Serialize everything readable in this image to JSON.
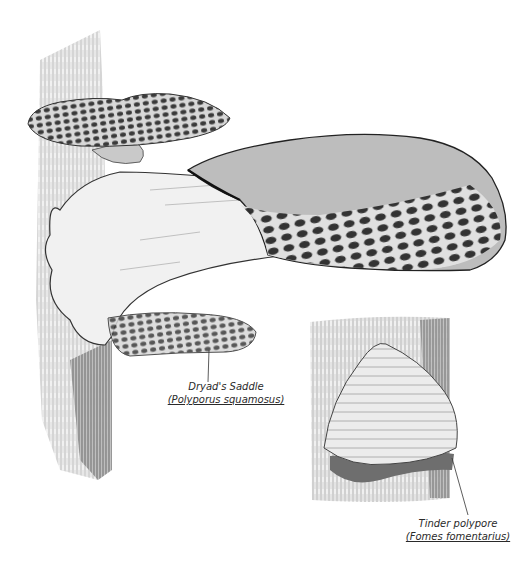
{
  "illustration": {
    "subject": "Pencil illustration of bracket fungi on tree trunks",
    "style": "graphite pencil sketch, monochrome",
    "colors": {
      "background": "#ffffff",
      "pencil_dark": "#2a2a2a",
      "pencil_mid": "#777777",
      "pencil_light": "#bdbdbd",
      "cap_fill": "#cfcfcf",
      "pale_fill": "#eeeeee"
    }
  },
  "labels": {
    "dryads_saddle": {
      "common_name": "Dryad's Saddle",
      "scientific_name": "(Polyporus squamosus)"
    },
    "tinder_polypore": {
      "common_name": "Tinder polypore",
      "scientific_name": "(Fomes fomentarius)"
    }
  }
}
